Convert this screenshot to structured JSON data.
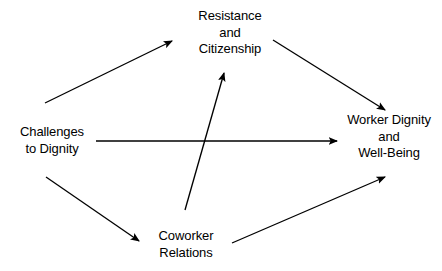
{
  "diagram": {
    "type": "concept-map",
    "background_color": "#ffffff",
    "line_color": "#000000",
    "text_color": "#000000",
    "nodes": [
      {
        "id": "challenges",
        "label": "Challenges\nto Dignity",
        "position": "left"
      },
      {
        "id": "resistance",
        "label": "Resistance\nand\nCitizenship",
        "position": "top"
      },
      {
        "id": "worker_dignity",
        "label": "Worker Dignity\nand\nWell-Being",
        "position": "right"
      },
      {
        "id": "coworker",
        "label": "Coworker\nRelations",
        "position": "bottom"
      }
    ],
    "edges": [
      {
        "id": "challenges-to-resistance",
        "from": "challenges",
        "to": "resistance",
        "x1": 45,
        "y1": 103,
        "x2": 172,
        "y2": 41
      },
      {
        "id": "resistance-to-worker-dignity",
        "from": "resistance",
        "to": "worker_dignity",
        "x1": 273,
        "y1": 40,
        "x2": 385,
        "y2": 110
      },
      {
        "id": "challenges-to-worker-dignity",
        "from": "challenges",
        "to": "worker_dignity",
        "x1": 96,
        "y1": 141,
        "x2": 337,
        "y2": 141
      },
      {
        "id": "challenges-to-coworker",
        "from": "challenges",
        "to": "coworker",
        "x1": 46,
        "y1": 177,
        "x2": 139,
        "y2": 241
      },
      {
        "id": "coworker-to-worker-dignity",
        "from": "coworker",
        "to": "worker_dignity",
        "x1": 232,
        "y1": 243,
        "x2": 385,
        "y2": 177
      },
      {
        "id": "coworker-to-resistance",
        "from": "coworker",
        "to": "resistance",
        "x1": 185,
        "y1": 210,
        "x2": 224,
        "y2": 73
      }
    ]
  }
}
